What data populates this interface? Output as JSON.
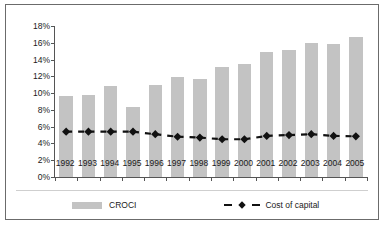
{
  "chart_data": {
    "type": "bar",
    "title": "",
    "subtitle": "",
    "xlabel": "",
    "ylabel": "",
    "ylim": [
      0,
      18
    ],
    "ytick_labels": [
      "0%",
      "2%",
      "4%",
      "6%",
      "8%",
      "10%",
      "12%",
      "14%",
      "16%",
      "18%"
    ],
    "ytick_values": [
      0,
      2,
      4,
      6,
      8,
      10,
      12,
      14,
      16,
      18
    ],
    "grid": false,
    "legend_position": "bottom",
    "categories": [
      "1992",
      "1993",
      "1994",
      "1995",
      "1996",
      "1997",
      "1998",
      "1999",
      "2000",
      "2001",
      "2002",
      "2003",
      "2004",
      "2005"
    ],
    "series": [
      {
        "name": "CROCI",
        "type": "bar",
        "color": "#c3c3c3",
        "values": [
          9.6,
          9.8,
          10.8,
          8.4,
          11.0,
          11.9,
          11.7,
          13.1,
          13.5,
          14.9,
          15.2,
          16.0,
          15.9,
          16.7
        ]
      },
      {
        "name": "Cost of capital",
        "type": "line",
        "color": "#111111",
        "marker": "diamond",
        "line_style": "dashed",
        "values": [
          5.4,
          5.4,
          5.4,
          5.4,
          5.1,
          4.8,
          4.7,
          4.5,
          4.5,
          4.9,
          5.0,
          5.1,
          4.9,
          4.85
        ]
      }
    ]
  },
  "legend": {
    "croci_label": "CROCI",
    "cost_label": "Cost of capital"
  },
  "colors": {
    "bar": "#c3c3c3",
    "line": "#111111",
    "axis": "#555555",
    "frame": "#6b6b6b",
    "background": "#ffffff"
  }
}
